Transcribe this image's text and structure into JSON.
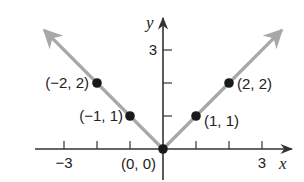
{
  "chart_data": {
    "type": "line",
    "title": "",
    "function": "y = |x|",
    "xlabel": "x",
    "ylabel": "y",
    "xlim": [
      -4.5,
      4
    ],
    "ylim": [
      -0.9,
      4
    ],
    "x_ticks": [
      -3,
      -2,
      -1,
      1,
      2,
      3
    ],
    "x_tick_labels": [
      {
        "value": -3,
        "label": "−3"
      },
      {
        "value": 3,
        "label": "3"
      }
    ],
    "y_ticks": [
      1,
      2,
      3
    ],
    "y_tick_labels": [
      {
        "value": 3,
        "label": "3"
      }
    ],
    "grid": false,
    "series": [
      {
        "name": "y = |x|",
        "color": "#a8a8a8",
        "arrows": true,
        "x": [
          -3.6,
          -2,
          -1,
          0,
          1,
          2,
          3.6
        ],
        "y": [
          3.6,
          2,
          1,
          0,
          1,
          2,
          3.6
        ]
      }
    ],
    "points": [
      {
        "x": -2,
        "y": 2,
        "label": "(−2, 2)"
      },
      {
        "x": -1,
        "y": 1,
        "label": "(−1, 1)"
      },
      {
        "x": 0,
        "y": 0,
        "label": "(0, 0)"
      },
      {
        "x": 1,
        "y": 1,
        "label": "(1, 1)"
      },
      {
        "x": 2,
        "y": 2,
        "label": "(2, 2)"
      }
    ],
    "colors": {
      "axis": "#333333",
      "curve": "#a8a8a8",
      "point": "#1a1a1a"
    }
  }
}
